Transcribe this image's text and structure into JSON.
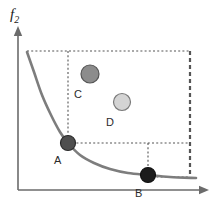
{
  "figure": {
    "background_color": "#ffffff",
    "width": 218,
    "height": 213
  },
  "axes": {
    "y_label_main": "f",
    "y_label_sub": "2",
    "x_label": "",
    "axis_color": "#6b6b6b",
    "origin_x": 18,
    "origin_y": 190,
    "y_axis_top": 30,
    "x_axis_right": 205,
    "show_ticks": false,
    "show_grid": false
  },
  "chart_data": {
    "type": "scatter",
    "title": "",
    "xlabel": "",
    "ylabel": "f2",
    "grid": false,
    "legend": "none",
    "curve": {
      "name": "pareto-front",
      "color": "#7d7d7d",
      "stroke_width": 2.6,
      "points": [
        [
          27,
          52
        ],
        [
          34,
          72
        ],
        [
          42,
          95
        ],
        [
          51,
          115
        ],
        [
          60,
          132
        ],
        [
          68,
          143
        ],
        [
          80,
          155
        ],
        [
          94,
          163
        ],
        [
          110,
          169
        ],
        [
          128,
          173
        ],
        [
          148,
          175
        ],
        [
          170,
          177
        ],
        [
          196,
          178
        ]
      ]
    },
    "points": [
      {
        "id": "A",
        "label": "A",
        "x": 68,
        "y": 143,
        "radius": 7.5,
        "fill": "#4f4f4f",
        "stroke": "#2b2b2b",
        "on_curve": true,
        "label_dx": -14,
        "label_dy": 12
      },
      {
        "id": "B",
        "label": "B",
        "x": 148,
        "y": 175,
        "radius": 7.5,
        "fill": "#1c1c1c",
        "stroke": "#101010",
        "on_curve": true,
        "label_dx": -13,
        "label_dy": 13
      },
      {
        "id": "C",
        "label": "C",
        "x": 90,
        "y": 74,
        "radius": 9,
        "fill": "#8c8c8c",
        "stroke": "#555555",
        "on_curve": false,
        "label_dx": -16,
        "label_dy": 15
      },
      {
        "id": "D",
        "label": "D",
        "x": 122,
        "y": 102,
        "radius": 8.5,
        "fill": "#d4d4d4",
        "stroke": "#7a7a7a",
        "on_curve": false,
        "label_dx": -16,
        "label_dy": 15
      }
    ],
    "reference_box": {
      "color": "#555555",
      "top_y": 51,
      "left_x": 27,
      "right_x": 190,
      "bottom_y": 177,
      "dash_thin": "2,2.2",
      "dash_bold": "4,3",
      "bold_stroke_width": 2.2,
      "thin_stroke_width": 1.1
    },
    "guide_lines": [
      {
        "name": "top-boundary",
        "x1": 27,
        "y1": 51,
        "x2": 190,
        "y2": 51,
        "style": "thin"
      },
      {
        "name": "right-boundary",
        "x1": 190,
        "y1": 51,
        "x2": 190,
        "y2": 177,
        "style": "bold"
      },
      {
        "name": "A-vertical",
        "x1": 68,
        "y1": 51,
        "x2": 68,
        "y2": 143,
        "style": "thin"
      },
      {
        "name": "A-horizontal",
        "x1": 68,
        "y1": 143,
        "x2": 190,
        "y2": 143,
        "style": "thin"
      },
      {
        "name": "B-vertical",
        "x1": 148,
        "y1": 143,
        "x2": 148,
        "y2": 175,
        "style": "thin"
      },
      {
        "name": "B-horizontal",
        "x1": 148,
        "y1": 177,
        "x2": 190,
        "y2": 177,
        "style": "thin"
      }
    ]
  }
}
